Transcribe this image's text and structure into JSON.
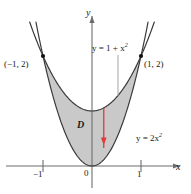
{
  "figure": {
    "background": "#ffffff",
    "axes": {
      "x_label": "x",
      "y_label": "y",
      "origin_label": "0",
      "x_ticks": [
        {
          "value": -1,
          "label": "−1"
        },
        {
          "value": 1,
          "label": "1"
        }
      ],
      "axis_color": "#6d6d6d",
      "origin_px": {
        "x": 92,
        "y": 166
      },
      "unit_px": {
        "x": 49,
        "y": 55
      },
      "x_range": [
        -1.6,
        1.85
      ],
      "y_range": [
        -0.45,
        2.95
      ]
    },
    "curves": [
      {
        "name": "upper-parabola",
        "equation_label": "y = 1 + x",
        "equation_exponent": "2",
        "expression": "y = 1 + x^2",
        "color": "#3b3b3b"
      },
      {
        "name": "lower-parabola",
        "equation_label": "y = 2x",
        "equation_exponent": "2",
        "expression": "y = 2x^2",
        "color": "#3b3b3b"
      }
    ],
    "intersection_points": [
      {
        "name": "left-intersection",
        "label": "(−1, 2)",
        "x": -1,
        "y": 2
      },
      {
        "name": "right-intersection",
        "label": "(1, 2)",
        "x": 1,
        "y": 2
      }
    ],
    "region": {
      "label": "D",
      "fill_color": "#c9c9c9",
      "stroke_color": "#3b3b3b"
    },
    "arrow": {
      "name": "vertical-strip-arrow",
      "color": "#e03a3a",
      "x": 0.24,
      "y_top": 1.06,
      "y_bottom": 0.38
    }
  },
  "chart_data": {
    "type": "line",
    "xlabel": "x",
    "ylabel": "y",
    "xlim": [
      -1.6,
      1.85
    ],
    "ylim": [
      -0.45,
      2.95
    ],
    "xticks": [
      -1,
      0,
      1
    ],
    "xticklabels": [
      "−1",
      "0",
      "1"
    ],
    "yticks": [],
    "yticklabels": [],
    "grid": false,
    "legend": "none",
    "series": [
      {
        "name": "y = 1 + x^2",
        "formula": "1 + x*x",
        "x": [
          -1.3,
          -1.0,
          -0.75,
          -0.5,
          -0.25,
          0,
          0.25,
          0.5,
          0.75,
          1.0,
          1.3
        ],
        "values": [
          2.69,
          2.0,
          1.5625,
          1.25,
          1.0625,
          1.0,
          1.0625,
          1.25,
          1.5625,
          2.0,
          2.69
        ]
      },
      {
        "name": "y = 2x^2",
        "formula": "2*x*x",
        "x": [
          -1.2,
          -1.0,
          -0.75,
          -0.5,
          -0.25,
          0,
          0.25,
          0.5,
          0.75,
          1.0,
          1.2
        ],
        "values": [
          2.88,
          2.0,
          1.125,
          0.5,
          0.125,
          0.0,
          0.125,
          0.5,
          1.125,
          2.0,
          2.88
        ]
      }
    ],
    "annotations": [
      {
        "text": "(−1, 2)",
        "x": -1,
        "y": 2
      },
      {
        "text": "(1, 2)",
        "x": 1,
        "y": 2
      },
      {
        "text": "D",
        "x": -0.3,
        "y": 0.75
      },
      {
        "text": "y = 1 + x^2",
        "x": 0.12,
        "y": 2.3
      },
      {
        "text": "y = 2x^2",
        "x": 0.95,
        "y": 0.65
      }
    ],
    "shaded_region": {
      "between": [
        "y = 2x^2",
        "y = 1 + x^2"
      ],
      "x_from": -1,
      "x_to": 1,
      "color": "#c9c9c9"
    }
  }
}
